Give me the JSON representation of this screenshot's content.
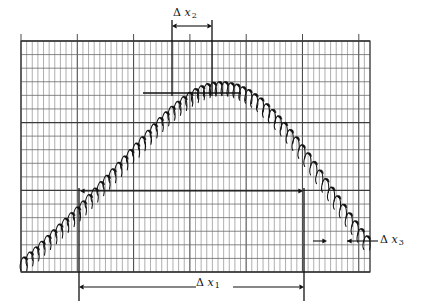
{
  "figure": {
    "name": "chart-recorder-trace",
    "background": "#ffffff",
    "grid_color": "#6e6e6e",
    "fine_grid_color": "#8c8c8c",
    "trace_color": "#111111",
    "annotation_color": "#111111"
  },
  "annotations": {
    "dx1": {
      "delta": "Δ",
      "var": "x",
      "sub": "1"
    },
    "dx2": {
      "delta": "Δ",
      "var": "x",
      "sub": "2"
    },
    "dx3": {
      "delta": "Δ",
      "var": "x",
      "sub": "3"
    }
  },
  "chart_data": {
    "type": "line",
    "title": "",
    "xlabel": "",
    "ylabel": "",
    "grid": true,
    "legend": null,
    "axis_ranges": {
      "xlim": [
        0,
        62
      ],
      "ylim": [
        0,
        17
      ]
    },
    "grid_spec": {
      "plot_box_px": {
        "x0": 21,
        "y0": 41,
        "x1": 370,
        "y1": 272
      },
      "fine_columns": 62,
      "fine_column_width_px": 5.63,
      "major_column_every": 10,
      "rows": 17,
      "row_height_px": 13.6,
      "heavy_rows": [
        0,
        6,
        11,
        17
      ],
      "top_tick_every_px": 56.3
    },
    "series": [
      {
        "name": "envelope-trace",
        "description": "oscillating chart-recorder pen trace forming an arch envelope",
        "x": [
          0,
          2,
          4,
          6,
          8,
          10,
          12,
          14,
          16,
          18,
          20,
          22,
          24,
          26,
          28,
          30,
          32,
          34,
          36,
          38,
          40,
          42,
          44,
          46,
          48,
          50,
          52,
          54,
          56,
          58,
          60,
          62
        ],
        "y": [
          0.6,
          1.3,
          2.1,
          2.9,
          3.7,
          4.5,
          5.4,
          6.3,
          7.2,
          8.1,
          9.0,
          9.9,
          10.8,
          11.6,
          12.3,
          12.9,
          13.3,
          13.5,
          13.5,
          13.3,
          12.9,
          12.3,
          11.5,
          10.6,
          9.6,
          8.5,
          7.3,
          6.1,
          4.9,
          3.7,
          2.6,
          1.6
        ],
        "oscillation_amplitude": 0.9,
        "oscillation_period_x": 1.05
      }
    ],
    "measurement_markers": [
      {
        "label": "Δx₁",
        "kind": "horizontal-span",
        "x_start_px": 79,
        "x_end_px": 304,
        "y_px": 287,
        "span_units": 40,
        "guide_lines": [
          {
            "x_px": 79,
            "y_top_px": 188,
            "y_bottom_px": 301
          },
          {
            "x_px": 304,
            "y_top_px": 188,
            "y_bottom_px": 301
          }
        ]
      },
      {
        "label": "Δx₂",
        "kind": "horizontal-span",
        "x_start_px": 172,
        "x_end_px": 212,
        "y_px": 26,
        "span_units": 7,
        "guide_lines": [
          {
            "x_px": 172,
            "y_top_px": 20,
            "y_bottom_px": 96
          },
          {
            "x_px": 212,
            "y_top_px": 20,
            "y_bottom_px": 96
          }
        ]
      },
      {
        "label": "Δx₃",
        "kind": "horizontal-span-outward",
        "x_start_px": 313,
        "x_end_px": 345,
        "y_px": 241,
        "span_units": 2,
        "leader_to_px": 378
      },
      {
        "label": "top-level-bar",
        "kind": "horizontal-rule",
        "x_start_px": 143,
        "x_end_px": 241,
        "y_px": 93
      },
      {
        "label": "mid-level-arrow",
        "kind": "horizontal-arrow",
        "x_start_px": 80,
        "x_end_px": 303,
        "y_px": 191
      }
    ]
  }
}
